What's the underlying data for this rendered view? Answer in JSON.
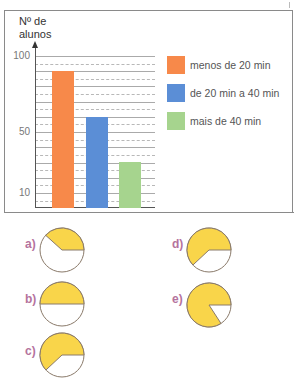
{
  "chart_data": [
    {
      "type": "bar",
      "title": "",
      "ylabel": "Nº de alunos",
      "xlabel": "",
      "ylim": [
        0,
        100
      ],
      "yticks": [
        10,
        50,
        100
      ],
      "grid": true,
      "legend_position": "right",
      "categories": [
        "menos de 20 min",
        "de 20 min a 40 min",
        "mais de 40 min"
      ],
      "values": [
        90,
        60,
        30
      ],
      "colors": [
        "#f7894a",
        "#5b8ed6",
        "#a6d48e"
      ]
    },
    {
      "type": "pie",
      "title": "Alternativas (setor amarelo)",
      "options": [
        {
          "label": "a)",
          "highlighted_degrees": 138
        },
        {
          "label": "b)",
          "highlighted_degrees": 180
        },
        {
          "label": "c)",
          "highlighted_degrees": 223
        },
        {
          "label": "d)",
          "highlighted_degrees": 223
        },
        {
          "label": "e)",
          "highlighted_degrees": 303
        }
      ],
      "colors": {
        "highlight": "#f9d54a",
        "rest": "#ffffff",
        "outline": "#8a7a6a"
      }
    }
  ],
  "chart": {
    "ylabel_line1": "Nº de",
    "ylabel_line2": "alunos",
    "ticks": [
      "100",
      "50",
      "10"
    ],
    "legend": [
      {
        "label": "menos de 20 min",
        "color": "#f7894a"
      },
      {
        "label": "de 20 min a 40 min",
        "color": "#5b8ed6"
      },
      {
        "label": "mais de 40 min",
        "color": "#a6d48e"
      }
    ]
  },
  "options": {
    "a": "a)",
    "b": "b)",
    "c": "c)",
    "d": "d)",
    "e": "e)"
  }
}
